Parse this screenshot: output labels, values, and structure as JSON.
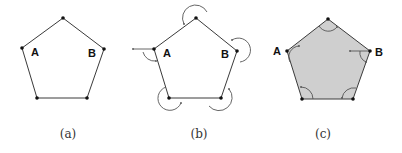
{
  "figure": {
    "panels": [
      {
        "id": "a",
        "caption": "(a)",
        "style": "outline",
        "vertices": {
          "top": [
            63,
            18
          ],
          "A": [
            22,
            48
          ],
          "B": [
            104,
            49
          ],
          "bottom_left": [
            37,
            98
          ],
          "bottom_right": [
            87,
            98
          ]
        },
        "labels": {
          "A": "A",
          "B": "B"
        },
        "angle_arcs": "none"
      },
      {
        "id": "b",
        "caption": "(b)",
        "style": "outline",
        "vertices": {
          "top": [
            196,
            18
          ],
          "A": [
            154,
            49
          ],
          "B": [
            237,
            51
          ],
          "bottom_left": [
            169,
            98
          ],
          "bottom_right": [
            221,
            98
          ]
        },
        "labels": {
          "A": "A",
          "B": "B"
        },
        "angle_arcs": "exterior"
      },
      {
        "id": "c",
        "caption": "(c)",
        "style": "filled",
        "fill_color": "#cfcfcf",
        "vertices": {
          "top": [
            328,
            19
          ],
          "A": [
            287,
            51
          ],
          "B": [
            370,
            51
          ],
          "bottom_left": [
            302,
            99
          ],
          "bottom_right": [
            353,
            99
          ]
        },
        "labels": {
          "A": "A",
          "B": "B"
        },
        "angle_arcs": "interior"
      }
    ]
  }
}
